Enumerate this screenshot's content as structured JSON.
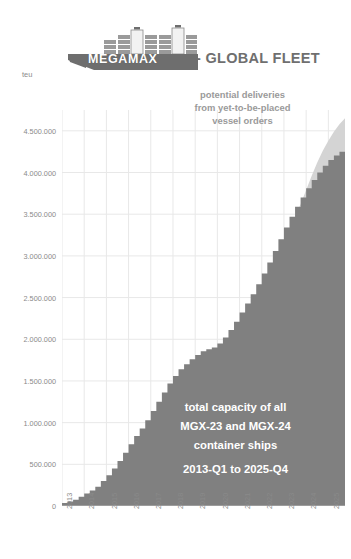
{
  "header": {
    "brand": "MEGAMAX",
    "suffix": "- GLOBAL FLEET",
    "logo_icon": "container-ship-icon"
  },
  "axis": {
    "y_unit": "teu"
  },
  "annotations": {
    "top": {
      "line1": "potential deliveries",
      "line2": "from yet-to-be-placed",
      "line3": "vessel orders"
    },
    "bottom": {
      "line1": "total capacity of all",
      "line2": "MGX-23 and MGX-24",
      "line3": "container ships",
      "line4": "2013-Q1 to 2025-Q4"
    }
  },
  "colors": {
    "actual_area": "#808080",
    "potential_area": "#d4d4d4",
    "gridline": "#e8e8e8",
    "axis_text": "#8a8a8a",
    "title_text": "#6f6f6f",
    "logo_hull": "#6e6e6e",
    "annotation_top_text": "#9a9a9a",
    "annotation_bottom_text": "#ffffff"
  },
  "chart_data": {
    "type": "area",
    "title": "MEGAMAX - GLOBAL FLEET",
    "subtitle": "total capacity of all MGX-23 and MGX-24 container ships, 2013-Q1 to 2025-Q4",
    "xlabel": "",
    "ylabel": "teu",
    "ylim": [
      0,
      4750000
    ],
    "xlim": [
      "2013-Q1",
      "2025-Q4"
    ],
    "grid": true,
    "legend_position": "none",
    "y_ticks": [
      0,
      500000,
      1000000,
      1500000,
      2000000,
      2500000,
      3000000,
      3500000,
      4000000,
      4500000
    ],
    "y_tick_labels": [
      "0",
      "500.000",
      "1.000.000",
      "1.500.000",
      "2.000.000",
      "2.500.000",
      "3.000.000",
      "3.500.000",
      "4.000.000",
      "4.500.000"
    ],
    "x_ticks": [
      "2013",
      "2014",
      "2015",
      "2016",
      "2017",
      "2018",
      "2019",
      "2020",
      "2021",
      "2022",
      "2023",
      "2024",
      "2025"
    ],
    "series": [
      {
        "name": "total capacity of all MGX-23 and MGX-24 container ships",
        "type": "area",
        "color": "#808080",
        "x": [
          "2013-Q1",
          "2013-Q2",
          "2013-Q3",
          "2013-Q4",
          "2014-Q1",
          "2014-Q2",
          "2014-Q3",
          "2014-Q4",
          "2015-Q1",
          "2015-Q2",
          "2015-Q3",
          "2015-Q4",
          "2016-Q1",
          "2016-Q2",
          "2016-Q3",
          "2016-Q4",
          "2017-Q1",
          "2017-Q2",
          "2017-Q3",
          "2017-Q4",
          "2018-Q1",
          "2018-Q2",
          "2018-Q3",
          "2018-Q4",
          "2019-Q1",
          "2019-Q2",
          "2019-Q3",
          "2019-Q4",
          "2020-Q1",
          "2020-Q2",
          "2020-Q3",
          "2020-Q4",
          "2021-Q1",
          "2021-Q2",
          "2021-Q3",
          "2021-Q4",
          "2022-Q1",
          "2022-Q2",
          "2022-Q3",
          "2022-Q4",
          "2023-Q1",
          "2023-Q2",
          "2023-Q3",
          "2023-Q4",
          "2024-Q1",
          "2024-Q2",
          "2024-Q3",
          "2024-Q4",
          "2025-Q1",
          "2025-Q2",
          "2025-Q3",
          "2025-Q4"
        ],
        "values": [
          0,
          37000,
          55000,
          75000,
          110000,
          150000,
          185000,
          230000,
          300000,
          370000,
          450000,
          540000,
          640000,
          740000,
          840000,
          930000,
          1030000,
          1140000,
          1250000,
          1360000,
          1470000,
          1560000,
          1640000,
          1700000,
          1760000,
          1810000,
          1855000,
          1880000,
          1900000,
          1950000,
          2020000,
          2110000,
          2210000,
          2320000,
          2430000,
          2540000,
          2660000,
          2790000,
          2920000,
          3060000,
          3200000,
          3340000,
          3470000,
          3590000,
          3700000,
          3810000,
          3910000,
          4000000,
          4080000,
          4150000,
          4205000,
          4250000
        ]
      },
      {
        "name": "potential deliveries from yet-to-be-placed vessel orders",
        "type": "area",
        "color": "#d4d4d4",
        "x": [
          "2023-Q3",
          "2023-Q4",
          "2024-Q1",
          "2024-Q2",
          "2024-Q3",
          "2024-Q4",
          "2025-Q1",
          "2025-Q2",
          "2025-Q3",
          "2025-Q4"
        ],
        "values": [
          3470000,
          3620000,
          3790000,
          3960000,
          4120000,
          4260000,
          4380000,
          4490000,
          4580000,
          4650000
        ]
      }
    ]
  }
}
